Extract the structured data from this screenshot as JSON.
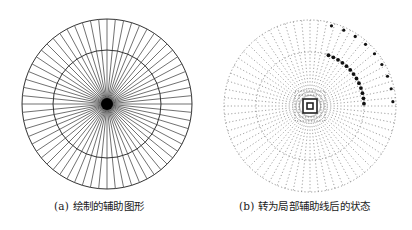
{
  "figures": [
    {
      "id": "a",
      "caption": "(a) 绘制的辅助图形",
      "style": "solid",
      "center": [
        107,
        104
      ],
      "outer_radius": 85,
      "inner_radius": 54,
      "ray_count": 64,
      "line_color": "#333333"
    },
    {
      "id": "b",
      "caption": "(b) 转为局部辅助线后的状态",
      "style": "dashed",
      "center": [
        104,
        106
      ],
      "outer_radius": 86,
      "inner_radius": 54,
      "ray_count": 64,
      "line_color": "#8a8a8a",
      "highlight_color": "#111111",
      "highlight_arc_deg": [
        -70,
        0
      ],
      "center_squares": [
        3,
        7,
        11,
        15
      ]
    }
  ]
}
